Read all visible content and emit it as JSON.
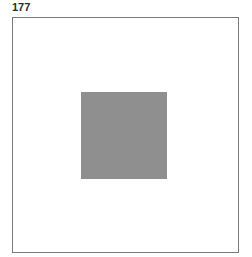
{
  "label": "177",
  "colors": {
    "background": "#ffffff",
    "frame_border": "#7a7a7a",
    "square_fill": "#8f8f8f",
    "label_text": "#2a2a2a"
  }
}
